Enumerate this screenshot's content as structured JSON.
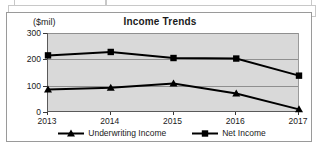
{
  "document": {
    "top_fragment_note": ""
  },
  "chart": {
    "title": "Income Trends",
    "y_axis_title": "($mil)",
    "plot_background": "#d9d9d9",
    "series_color": "#000000"
  },
  "chart_data": {
    "type": "line",
    "title": "Income Trends",
    "xlabel": "",
    "ylabel": "($mil)",
    "ylim": [
      0,
      300
    ],
    "yticks": [
      0,
      100,
      200,
      300
    ],
    "grid": true,
    "legend_position": "bottom",
    "categories": [
      "2013",
      "2014",
      "2015",
      "2016",
      "2017"
    ],
    "series": [
      {
        "name": "Underwriting Income",
        "marker": "triangle",
        "values": [
          85,
          92,
          108,
          70,
          10
        ]
      },
      {
        "name": "Net Income",
        "marker": "square",
        "values": [
          215,
          228,
          205,
          203,
          138
        ]
      }
    ]
  }
}
